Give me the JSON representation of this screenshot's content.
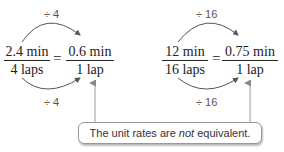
{
  "left": {
    "top_operation": "÷ 4",
    "bottom_operation": "÷ 4",
    "fraction1": {
      "numerator": "2.4 min",
      "denominator": "4 laps"
    },
    "equals": "=",
    "fraction2": {
      "numerator": "0.6 min",
      "denominator": "1 lap"
    }
  },
  "right": {
    "top_operation": "÷ 16",
    "bottom_operation": "÷ 16",
    "fraction1": {
      "numerator": "12 min",
      "denominator": "16 laps"
    },
    "equals": "=",
    "fraction2": {
      "numerator": "0.75 min",
      "denominator": "1 lap"
    }
  },
  "callout": {
    "text_before": "The unit rates are ",
    "emphasis": "not",
    "text_after": " equivalent."
  }
}
